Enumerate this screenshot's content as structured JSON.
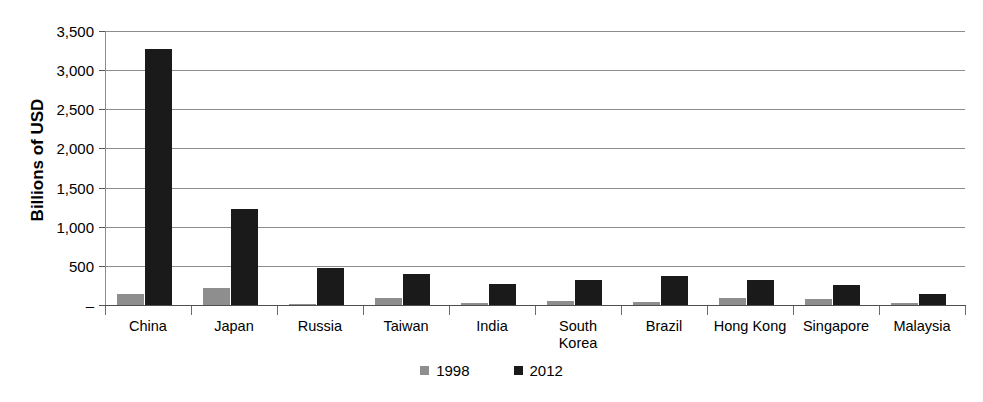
{
  "chart_data": {
    "type": "bar",
    "title": "",
    "xlabel": "",
    "ylabel": "Billions of USD",
    "ylim": [
      0,
      3500
    ],
    "yticks": [
      0,
      500,
      1000,
      1500,
      2000,
      2500,
      3000,
      3500
    ],
    "ytick_labels": [
      "–",
      "500",
      "1,000",
      "1,500",
      "2,000",
      "2,500",
      "3,000",
      "3,500"
    ],
    "grid": true,
    "legend_position": "bottom-center",
    "categories": [
      "China",
      "Japan",
      "Russia",
      "Taiwan",
      "India",
      "South\nKorea",
      "Brazil",
      "Hong Kong",
      "Singapore",
      "Malaysia"
    ],
    "series": [
      {
        "name": "1998",
        "color": "#8e8e8e",
        "values": [
          145,
          215,
          12,
          90,
          28,
          52,
          43,
          90,
          75,
          26
        ]
      },
      {
        "name": "2012",
        "color": "#1a1a1a",
        "values": [
          3270,
          1230,
          470,
          400,
          265,
          325,
          370,
          320,
          255,
          140
        ]
      }
    ]
  },
  "axis": {
    "y_title": "Billions of USD"
  },
  "legend": {
    "items": [
      {
        "label": "1998",
        "color": "#8e8e8e"
      },
      {
        "label": "2012",
        "color": "#1a1a1a"
      }
    ]
  },
  "colors": {
    "series_1998": "#8e8e8e",
    "series_2012": "#1a1a1a",
    "gridline": "#8c8c8c",
    "axis": "#4d4d4d",
    "text": "#000000",
    "background": "#ffffff"
  }
}
